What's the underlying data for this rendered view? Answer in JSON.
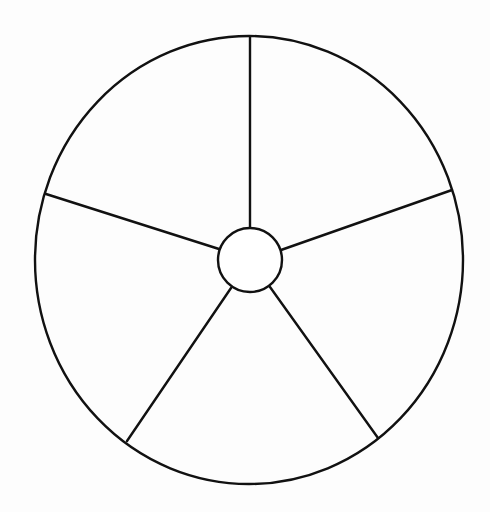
{
  "diagram": {
    "type": "five-sector-circle",
    "background": "#fdfdfd",
    "stroke_color": "#111111",
    "stroke_width": 2.4,
    "outer": {
      "cx": 249,
      "cy": 260,
      "rx": 214,
      "ry": 224
    },
    "hub": {
      "cx": 250,
      "cy": 260,
      "r": 32
    },
    "spokes": [
      {
        "name": "spoke-top",
        "x1": 250,
        "y1": 228,
        "x2": 250,
        "y2": 37
      },
      {
        "name": "spoke-upper-right",
        "x1": 281,
        "y1": 250,
        "x2": 452,
        "y2": 190
      },
      {
        "name": "spoke-lower-right",
        "x1": 270,
        "y1": 287,
        "x2": 378,
        "y2": 438
      },
      {
        "name": "spoke-lower-left",
        "x1": 231,
        "y1": 288,
        "x2": 127,
        "y2": 441
      },
      {
        "name": "spoke-upper-left",
        "x1": 219,
        "y1": 249,
        "x2": 46,
        "y2": 194
      }
    ],
    "sectors": [
      "",
      "",
      "",
      "",
      ""
    ]
  }
}
